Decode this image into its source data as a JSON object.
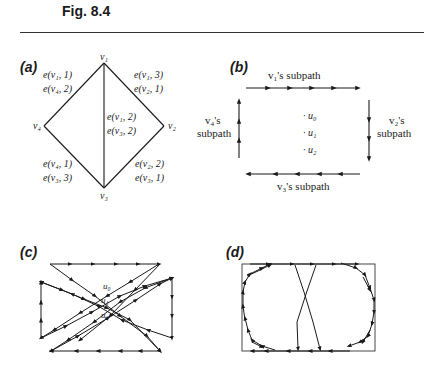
{
  "figure": {
    "title": "Fig. 8.4",
    "panels": {
      "a": {
        "label": "(a)",
        "vertices": [
          "v1",
          "v2",
          "v3",
          "v4"
        ],
        "vertex_labels": {
          "v1": "v₁",
          "v2": "v₂",
          "v3": "v₃",
          "v4": "v₄"
        },
        "edge_labels": {
          "v1_v4": [
            "e(v₁, 1)",
            "e(v₄, 2)"
          ],
          "v1_v2": [
            "e(v₁, 3)",
            "e(v₂, 1)"
          ],
          "v1_v3": [
            "e(v₁, 2)",
            "e(v₃, 2)"
          ],
          "v4_v3": [
            "e(v₄, 1)",
            "e(v₃, 3)"
          ],
          "v2_v3": [
            "e(v₂, 2)",
            "e(v₃, 1)"
          ]
        }
      },
      "b": {
        "label": "(b)",
        "subpaths": {
          "top": "v₁'s subpath",
          "right_line1": "v₂'s",
          "right_line2": "subpath",
          "bottom": "v₃'s subpath",
          "left_line1": "v₄'s",
          "left_line2": "subpath"
        },
        "points": [
          "· u₀",
          "· u₁",
          "· u₂"
        ]
      },
      "c": {
        "label": "(c)",
        "points": [
          "u₀",
          "u₁",
          "u₂"
        ]
      },
      "d": {
        "label": "(d)"
      }
    }
  }
}
